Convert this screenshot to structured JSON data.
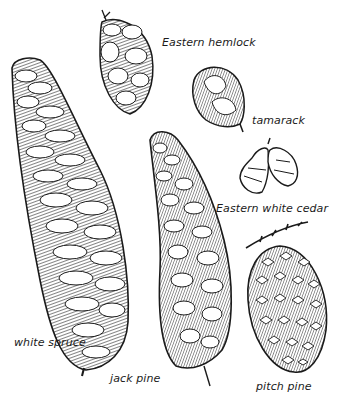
{
  "illustration": {
    "style": "pen-and-ink line art",
    "ink_color": "#1a1a1a",
    "paper_color": "#ffffff",
    "cones": [
      {
        "id": "eastern-hemlock",
        "label": "Eastern hemlock"
      },
      {
        "id": "tamarack",
        "label": "tamarack"
      },
      {
        "id": "eastern-white-cedar",
        "label": "Eastern white cedar"
      },
      {
        "id": "white-spruce",
        "label": "white spruce"
      },
      {
        "id": "jack-pine",
        "label": "jack pine"
      },
      {
        "id": "pitch-pine",
        "label": "pitch pine"
      }
    ]
  }
}
